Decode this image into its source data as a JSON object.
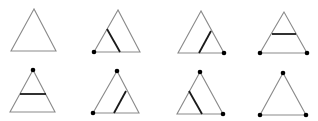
{
  "figure": {
    "colors": {
      "triangle_stroke": "#8a8a8a",
      "cut_line": "#1a1a1a",
      "dot": "#000000",
      "background": "#ffffff"
    },
    "triangles": [
      {
        "id": 1,
        "apex": [
          34,
          9
        ],
        "left": [
          11,
          51
        ],
        "right": [
          56,
          51
        ],
        "cut": null,
        "dots": []
      },
      {
        "id": 2,
        "apex": [
          118,
          10
        ],
        "left": [
          94,
          52
        ],
        "right": [
          140,
          52
        ],
        "cut": [
          [
            107,
            29
          ],
          [
            120,
            52
          ]
        ],
        "dots": [
          "left"
        ]
      },
      {
        "id": 3,
        "apex": [
          201,
          11
        ],
        "left": [
          178,
          53
        ],
        "right": [
          224,
          53
        ],
        "cut": [
          [
            211,
            31
          ],
          [
            199,
            53
          ]
        ],
        "dots": [
          "right"
        ]
      },
      {
        "id": 4,
        "apex": [
          284,
          12
        ],
        "left": [
          260,
          53
        ],
        "right": [
          307,
          53
        ],
        "cut": [
          [
            272,
            34
          ],
          [
            296,
            34
          ]
        ],
        "dots": [
          "left",
          "right"
        ]
      },
      {
        "id": 5,
        "apex": [
          33,
          70
        ],
        "left": [
          10,
          112
        ],
        "right": [
          55,
          112
        ],
        "cut": [
          [
            20,
            94
          ],
          [
            46,
            94
          ]
        ],
        "dots": [
          "apex"
        ]
      },
      {
        "id": 6,
        "apex": [
          117,
          71
        ],
        "left": [
          93,
          113
        ],
        "right": [
          139,
          113
        ],
        "cut": [
          [
            126,
            91
          ],
          [
            114,
            113
          ]
        ],
        "dots": [
          "apex",
          "left"
        ]
      },
      {
        "id": 7,
        "apex": [
          200,
          72
        ],
        "left": [
          177,
          114
        ],
        "right": [
          223,
          114
        ],
        "cut": [
          [
            189,
            91
          ],
          [
            202,
            114
          ]
        ],
        "dots": [
          "apex",
          "right"
        ]
      },
      {
        "id": 8,
        "apex": [
          283,
          73
        ],
        "left": [
          260,
          115
        ],
        "right": [
          306,
          115
        ],
        "cut": null,
        "dots": [
          "apex",
          "left",
          "right"
        ]
      }
    ]
  }
}
